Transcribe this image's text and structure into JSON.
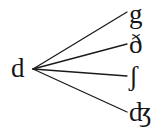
{
  "diagram": {
    "type": "branching-tree",
    "background_color": "#ffffff",
    "edge_color": "#1a1a1a",
    "text_color": "#161616",
    "source": {
      "id": "source-d",
      "label": "d",
      "x": 20,
      "y": 69
    },
    "vertex": {
      "x": 33,
      "y": 69
    },
    "targets": [
      {
        "id": "target-g",
        "label": "g",
        "x": 136,
        "y": 14,
        "edge_end_x": 127,
        "edge_end_y": 12
      },
      {
        "id": "target-eth",
        "label": "ð",
        "x": 136,
        "y": 45,
        "edge_end_x": 127,
        "edge_end_y": 44
      },
      {
        "id": "target-esh",
        "label": "ʃ",
        "x": 136,
        "y": 77,
        "edge_end_x": 127,
        "edge_end_y": 76
      },
      {
        "id": "target-dezh",
        "label": "ʤ",
        "x": 136,
        "y": 113,
        "edge_end_x": 127,
        "edge_end_y": 112
      }
    ],
    "edges": [
      {
        "id": "edge-d-to-g",
        "from": "d",
        "to": "g"
      },
      {
        "id": "edge-d-to-eth",
        "from": "d",
        "to": "ð"
      },
      {
        "id": "edge-d-to-esh",
        "from": "d",
        "to": "ʃ"
      },
      {
        "id": "edge-d-to-dezh",
        "from": "d",
        "to": "ʤ"
      }
    ]
  }
}
